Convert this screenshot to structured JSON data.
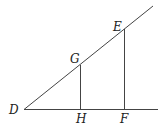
{
  "diagram": {
    "type": "geometry-similar-triangles",
    "points": {
      "D": {
        "label": "D",
        "x": 24,
        "y": 109
      },
      "G": {
        "label": "G",
        "x": 80,
        "y": 66
      },
      "H": {
        "label": "H",
        "x": 80,
        "y": 109
      },
      "E": {
        "label": "E",
        "x": 124,
        "y": 29
      },
      "F": {
        "label": "F",
        "x": 124,
        "y": 109
      }
    },
    "segments": [
      "D-ray through G,E",
      "D-baseline through H,F",
      "GH",
      "EF"
    ],
    "stroke_color": "#444444"
  }
}
